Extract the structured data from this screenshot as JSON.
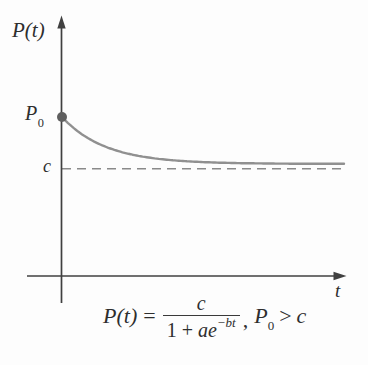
{
  "figure": {
    "y_axis_label": "P(t)",
    "x_axis_label": "t",
    "initial_point_label": {
      "base": "P",
      "sub": "0"
    },
    "asymptote_label": "c"
  },
  "formula": {
    "lhs_var": "P(t)",
    "lhs_eq": "=",
    "fraction": {
      "numerator": "c",
      "den_prefix": "1 + ",
      "den_var": "ae",
      "den_exp": "−bt"
    },
    "separator": ",",
    "condition": {
      "base": "P",
      "sub": "0",
      "relation": ">",
      "rhs": "c"
    }
  },
  "colors": {
    "axis": "#404040",
    "curve": "#909090",
    "asymptote_dash": "#8a8a8a",
    "point": "#5f5f5f",
    "text": "#2e2e2e",
    "background": "#fdfdfd"
  },
  "chart_data": {
    "type": "line",
    "title": "",
    "xlabel": "t",
    "ylabel": "P(t)",
    "equation": "P(t) = c / (1 + a·e^(−bt)), P0 > c",
    "axes_numeric": false,
    "grid": false,
    "legend_position": "none",
    "annotations": [
      {
        "label": "P0",
        "meaning": "initial value marked by dot on vertical axis at t = 0",
        "normalized_value": 1.0
      },
      {
        "label": "c",
        "meaning": "horizontal dashed asymptote approached as t increases",
        "normalized_value": 0.675
      }
    ],
    "series": [
      {
        "name": "P(t)",
        "shape": "exponential decay from P0 toward c, concave up, monotonically decreasing"
      }
    ],
    "normalized": {
      "units": "no numeric scale shown; values normalized to P0 = 1",
      "p0": 1.0,
      "c": 0.675,
      "curve_asymptote": 0.705,
      "decay": 6.5,
      "t_range": [
        0,
        1
      ]
    }
  }
}
